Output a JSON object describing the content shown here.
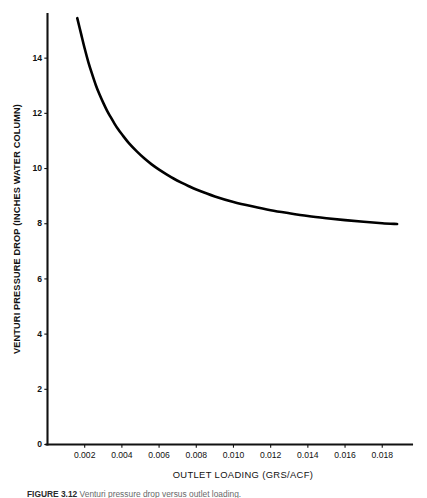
{
  "figure": {
    "caption_number": "FIGURE 3.12",
    "caption_text": "Venturi pressure drop versus outlet loading."
  },
  "chart_data": {
    "type": "line",
    "title": "",
    "subtitle": "",
    "xlabel": "OUTLET LOADING (GRS/ACF)",
    "ylabel": "VENTURI PRESSURE DROP (INCHES WATER COLUMN)",
    "xlim": [
      0.0,
      0.0196
    ],
    "ylim": [
      0,
      15.6
    ],
    "xticks": [
      0.002,
      0.004,
      0.006,
      0.008,
      0.01,
      0.012,
      0.014,
      0.016,
      0.018
    ],
    "xtick_labels": [
      "0.002",
      "0.004",
      "0.006",
      "0.008",
      "0.010",
      "0.012",
      "0.014",
      "0.016",
      "0.018"
    ],
    "yticks": [
      0,
      2,
      4,
      6,
      8,
      10,
      12,
      14
    ],
    "ytick_labels": [
      "0",
      "2",
      "4",
      "6",
      "8",
      "10",
      "12",
      "14"
    ],
    "grid": false,
    "legend": false,
    "legend_position": "none",
    "series": [
      {
        "name": "Venturi pressure drop",
        "color": "#000000",
        "x": [
          0.0016,
          0.0018,
          0.002,
          0.0022,
          0.0024,
          0.0026,
          0.0028,
          0.003,
          0.0032,
          0.0034,
          0.0036,
          0.0038,
          0.004,
          0.0044,
          0.0048,
          0.0052,
          0.0056,
          0.006,
          0.0064,
          0.0068,
          0.0072,
          0.0076,
          0.008,
          0.009,
          0.01,
          0.011,
          0.012,
          0.013,
          0.014,
          0.015,
          0.016,
          0.017,
          0.018,
          0.0188
        ],
        "y": [
          15.45,
          14.9,
          14.35,
          13.85,
          13.42,
          13.02,
          12.68,
          12.38,
          12.1,
          11.86,
          11.63,
          11.42,
          11.24,
          10.9,
          10.62,
          10.37,
          10.15,
          9.96,
          9.79,
          9.63,
          9.49,
          9.36,
          9.24,
          8.99,
          8.79,
          8.63,
          8.49,
          8.38,
          8.28,
          8.2,
          8.13,
          8.07,
          8.02,
          7.99
        ]
      }
    ]
  },
  "axis": {
    "y_axis_name": "y-axis",
    "x_axis_name": "x-axis"
  }
}
